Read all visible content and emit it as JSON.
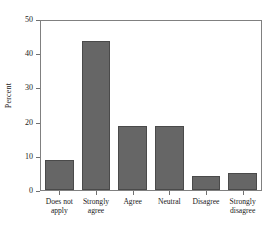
{
  "chart_data": {
    "type": "bar",
    "title": "",
    "subtitle": "",
    "xlabel": "",
    "ylabel": "Percent",
    "categories": [
      "Does not apply",
      "Strongly agree",
      "Agree",
      "Neutral",
      "Disagree",
      "Strongly disagree"
    ],
    "category_lines": [
      [
        "Does not",
        "apply"
      ],
      [
        "Strongly",
        "agree"
      ],
      [
        "Agree"
      ],
      [
        "Neutral"
      ],
      [
        "Disagree"
      ],
      [
        "Strongly",
        "disagree"
      ]
    ],
    "values": [
      9,
      44,
      19,
      19,
      4,
      5
    ],
    "ylim": [
      0,
      50
    ],
    "yticks": [
      0,
      10,
      20,
      30,
      40,
      50
    ],
    "ytick_labels": [
      "0",
      "10",
      "20",
      "30",
      "40",
      "50"
    ],
    "grid": false,
    "legend": null,
    "bar_color": "#666666",
    "bar_edge_color": "#4a4a4a",
    "axis_color": "#808080",
    "text_color": "#1a1a1a",
    "background": "#ffffff"
  }
}
